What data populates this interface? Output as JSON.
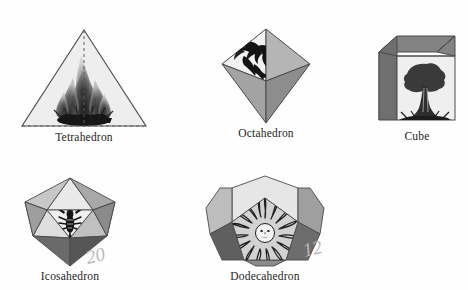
{
  "page": {
    "background": "#fefefe"
  },
  "palette": {
    "outline": "#4a4a4a",
    "face_lightest": "#f0f0f0",
    "face_light": "#dcdcdc",
    "face_mid": "#bdbdbd",
    "face_dark": "#9a9a9a",
    "face_darkest": "#6e6e6e",
    "emblem": "#2a2a2a",
    "caption_color": "#1d1d1d",
    "annotation_color": "#b9b9b9"
  },
  "solids": [
    {
      "id": "tetrahedron",
      "label": "Tetrahedron",
      "emblem": "fire-emblem",
      "element": "Fire",
      "faces": 4,
      "hidden_edges": "dashed",
      "position": {
        "x": 18,
        "y": 26
      }
    },
    {
      "id": "octahedron",
      "label": "Octahedron",
      "emblem": "eagle-emblem",
      "element": "Air",
      "faces": 8,
      "hidden_edges": "none",
      "position": {
        "x": 214,
        "y": 26
      }
    },
    {
      "id": "cube",
      "label": "Cube",
      "emblem": "tree-emblem",
      "element": "Earth",
      "faces": 6,
      "hidden_edges": "none",
      "position": {
        "x": 377,
        "y": 34
      }
    },
    {
      "id": "icosahedron",
      "label": "Icosahedron",
      "emblem": "lobster-emblem",
      "element": "Water",
      "faces": 20,
      "hidden_edges": "none",
      "position": {
        "x": 11,
        "y": 176
      }
    },
    {
      "id": "dodecahedron",
      "label": "Dodecahedron",
      "emblem": "sun-emblem",
      "element": "Aether",
      "faces": 12,
      "hidden_edges": "none",
      "position": {
        "x": 204,
        "y": 174
      }
    }
  ],
  "annotations": [
    {
      "id": "icosahedron-count",
      "text": "20",
      "position": {
        "x": 86,
        "y": 245
      }
    },
    {
      "id": "dodecahedron-count",
      "text": "12",
      "position": {
        "x": 303,
        "y": 238
      }
    }
  ]
}
